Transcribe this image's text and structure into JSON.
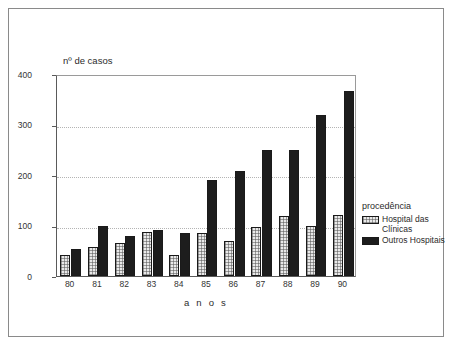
{
  "chart_data": {
    "type": "bar",
    "title": "",
    "subtitle": "",
    "xlabel": "a n o s",
    "ylabel": "nº de casos",
    "categories": [
      "80",
      "81",
      "82",
      "83",
      "84",
      "85",
      "86",
      "87",
      "88",
      "89",
      "90"
    ],
    "series": [
      {
        "name": "Hospital das Clínicas",
        "values": [
          42,
          58,
          65,
          88,
          42,
          85,
          70,
          97,
          119,
          100,
          120
        ],
        "color": "#e9e9e9",
        "pattern": "stippled-checker",
        "border_color": "#1a1a1a"
      },
      {
        "name": "Outros Hospitais",
        "values": [
          53,
          99,
          80,
          92,
          86,
          190,
          207,
          250,
          250,
          318,
          367
        ],
        "color": "#1d1d1d",
        "pattern": "solid",
        "border_color": "#1a1a1a"
      }
    ],
    "ylim": [
      0,
      400
    ],
    "yticks": [
      0,
      100,
      200,
      300,
      400
    ],
    "ytick_labels": [
      "0",
      "100",
      "200",
      "300",
      "400"
    ],
    "grid": true,
    "grid_style": "dotted-horizontal",
    "legend_position": "right",
    "legend_title": "procedência"
  },
  "legend": {
    "title": "procedência",
    "entries": [
      {
        "label_line1": "Hospital das",
        "label_line2": "Clínicas",
        "swatch": "hatched-light-swatch"
      },
      {
        "label_line1": "Outros Hospitais",
        "label_line2": "",
        "swatch": "solid-black-swatch"
      }
    ]
  },
  "axes": {
    "y_title": "nº de casos",
    "x_title": "a n o s"
  }
}
